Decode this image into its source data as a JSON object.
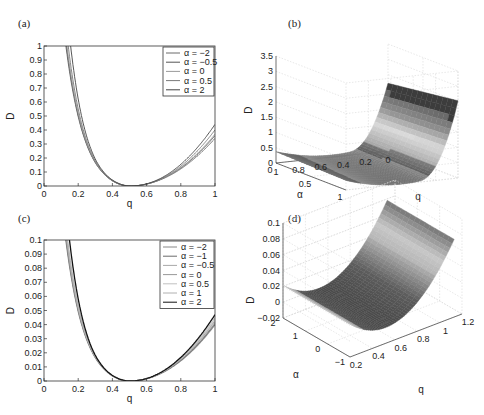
{
  "chart_data": [
    {
      "panel": "(a)",
      "type": "line",
      "xlabel": "q",
      "ylabel": "D",
      "xlim": [
        0,
        1
      ],
      "ylim": [
        0,
        1
      ],
      "xticks": [
        "0",
        "0.2",
        "0.4",
        "0.6",
        "0.8",
        "1"
      ],
      "yticks": [
        "0",
        "0.1",
        "0.2",
        "0.3",
        "0.4",
        "0.5",
        "0.6",
        "0.7",
        "0.8",
        "0.9",
        "1"
      ],
      "legend_position": "upper right",
      "series": [
        {
          "name": "α = −2",
          "color": "#6a6a6a",
          "k": 1.0,
          "shift": 0.0,
          "right": 0.34
        },
        {
          "name": "α = −0.5",
          "color": "#555555",
          "k": 1.05,
          "shift": 0.005,
          "right": 0.36
        },
        {
          "name": "α = 0",
          "color": "#9a9a9a",
          "k": 1.1,
          "shift": 0.01,
          "right": 0.37
        },
        {
          "name": "α = 0.5",
          "color": "#7a7a7a",
          "k": 1.25,
          "shift": 0.02,
          "right": 0.4
        },
        {
          "name": "α = 2",
          "color": "#444444",
          "k": 1.6,
          "shift": 0.03,
          "right": 0.44
        }
      ]
    },
    {
      "panel": "(b)",
      "type": "surface",
      "xlabel": "q",
      "ylabel": "α",
      "zlabel": "D",
      "zticks": [
        "0",
        "0.5",
        "1",
        "1.5",
        "2",
        "2.5",
        "3",
        "3.5"
      ],
      "alpha_ticks": [
        "0",
        "0.5",
        "1"
      ],
      "q_ticks": [
        "1",
        "0.8",
        "0.6",
        "0.4",
        "0.2",
        "0"
      ],
      "zlim": [
        0,
        3.5
      ]
    },
    {
      "panel": "(c)",
      "type": "line",
      "xlabel": "q",
      "ylabel": "D",
      "xlim": [
        0,
        1
      ],
      "ylim": [
        0,
        0.1
      ],
      "xticks": [
        "0",
        "0.2",
        "0.4",
        "0.6",
        "0.8",
        "1"
      ],
      "yticks": [
        "0",
        "0.01",
        "0.02",
        "0.03",
        "0.04",
        "0.05",
        "0.06",
        "0.07",
        "0.08",
        "0.09",
        "0.1"
      ],
      "legend_position": "upper right",
      "series": [
        {
          "name": "α = −2",
          "color": "#888888",
          "k": 1.0,
          "shift": 0.0,
          "right": 0.04
        },
        {
          "name": "α = −1",
          "color": "#6a6a6a",
          "k": 1.03,
          "shift": 0.002,
          "right": 0.041
        },
        {
          "name": "α = −0.5",
          "color": "#a8a8a8",
          "k": 1.06,
          "shift": 0.004,
          "right": 0.042
        },
        {
          "name": "α = 0",
          "color": "#999999",
          "k": 1.1,
          "shift": 0.006,
          "right": 0.043
        },
        {
          "name": "α = 0.5",
          "color": "#c0c0c0",
          "k": 1.15,
          "shift": 0.008,
          "right": 0.044
        },
        {
          "name": "α = 1",
          "color": "#b0b0b0",
          "k": 1.2,
          "shift": 0.01,
          "right": 0.045
        },
        {
          "name": "α = 2",
          "color": "#111111",
          "k": 1.45,
          "shift": 0.015,
          "right": 0.047
        }
      ]
    },
    {
      "panel": "(d)",
      "type": "surface",
      "xlabel": "q",
      "ylabel": "α",
      "zlabel": "D",
      "zticks": [
        "−0.02",
        "0",
        "0.02",
        "0.04",
        "0.06",
        "0.08",
        "0.1"
      ],
      "alpha_ticks": [
        "2",
        "1",
        "0",
        "−1"
      ],
      "q_ticks": [
        "0.2",
        "0.4",
        "0.6",
        "0.8",
        "1",
        "1.2"
      ],
      "zlim": [
        -0.02,
        0.1
      ]
    }
  ],
  "labels": {
    "a": "(a)",
    "b": "(b)",
    "c": "(c)",
    "d": "(d)"
  }
}
